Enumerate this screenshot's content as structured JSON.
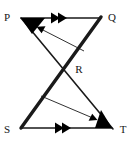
{
  "figure": {
    "background_color": "#ffffff",
    "stroke_color": "#1a1a1a",
    "marker_fill": "#000000",
    "width": 136,
    "height": 143,
    "vertices": [
      {
        "name": "P",
        "label": "P",
        "x": 21,
        "y": 18,
        "label_x": 7,
        "label_y": 18
      },
      {
        "name": "Q",
        "label": "Q",
        "x": 100,
        "y": 18,
        "label_x": 112,
        "label_y": 18
      },
      {
        "name": "R",
        "label": "R",
        "x": 68,
        "y": 65,
        "label_x": 79,
        "label_y": 70
      },
      {
        "name": "S",
        "label": "S",
        "x": 21,
        "y": 128,
        "label_x": 7,
        "label_y": 130
      },
      {
        "name": "T",
        "label": "T",
        "x": 112,
        "y": 128,
        "label_x": 123,
        "label_y": 130
      }
    ],
    "segments": [
      {
        "name": "segment-pq",
        "from": "P",
        "to": "Q",
        "x1": 21,
        "y1": 18,
        "x2": 100,
        "y2": 18,
        "width": 1.6,
        "tick_marker": "double-chevron"
      },
      {
        "name": "segment-st",
        "from": "S",
        "to": "T",
        "x1": 21,
        "y1": 128,
        "x2": 112,
        "y2": 128,
        "width": 1.6,
        "tick_marker": "double-chevron"
      },
      {
        "name": "segment-sq",
        "from": "S",
        "to": "Q",
        "x1": 21,
        "y1": 128,
        "x2": 101,
        "y2": 17,
        "width": 3.4,
        "tick_marker": "none"
      },
      {
        "name": "segment-pt",
        "from": "P",
        "to": "T",
        "x1": 21,
        "y1": 18,
        "x2": 113,
        "y2": 129,
        "width": 1.6,
        "tick_marker": "none"
      }
    ],
    "angle_markers": [
      {
        "name": "angle-marker-p",
        "at": "P",
        "fill": "#000000"
      },
      {
        "name": "angle-marker-t",
        "at": "T",
        "fill": "#000000"
      }
    ],
    "annotation_arrows": [
      {
        "name": "annotation-arrow-upper",
        "x1": 84,
        "y1": 51,
        "x2": 37,
        "y2": 27,
        "direction": "up-left",
        "width": 0.9
      },
      {
        "name": "annotation-arrow-lower",
        "x1": 41,
        "y1": 96,
        "x2": 97,
        "y2": 120,
        "direction": "down-right",
        "width": 0.9
      }
    ],
    "parallel_mark_count": 2
  }
}
